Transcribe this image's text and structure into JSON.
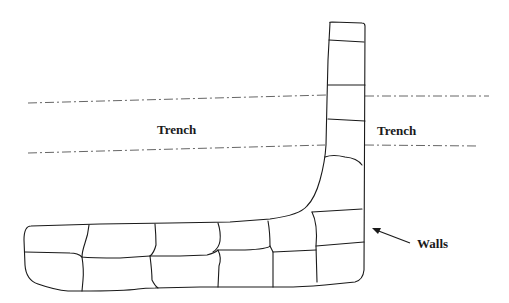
{
  "diagram": {
    "labels": {
      "trench_left": "Trench",
      "trench_right": "Trench",
      "walls": "Walls"
    },
    "colors": {
      "stroke": "#1a1a1a",
      "dash": "#555555",
      "background": "#ffffff"
    }
  }
}
